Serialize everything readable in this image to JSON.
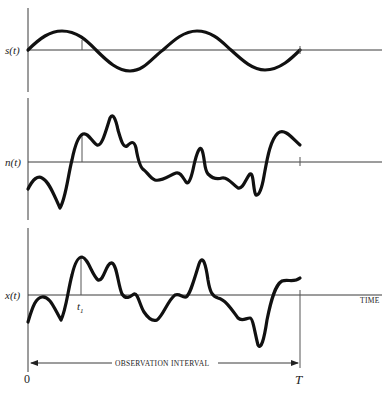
{
  "figure": {
    "panels": [
      {
        "id": "signal",
        "label": "s(t)",
        "description": "sinusoidal signal"
      },
      {
        "id": "noise",
        "label": "n(t)",
        "description": "random noise waveform"
      },
      {
        "id": "received",
        "label": "x(t)",
        "description": "signal plus noise"
      }
    ],
    "time_axis_label": "TIME",
    "sample_time_label": "t",
    "sample_time_subscript": "1",
    "interval_label": "OBSERVATION INTERVAL",
    "interval_start": "0",
    "interval_end": "T"
  }
}
